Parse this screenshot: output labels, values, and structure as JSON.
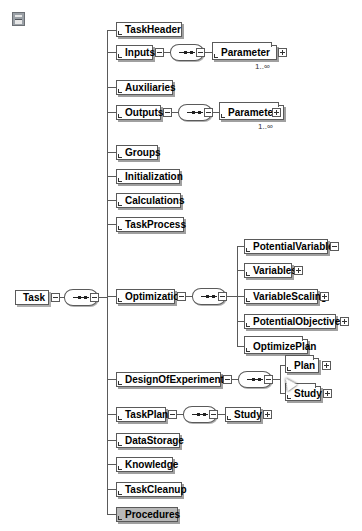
{
  "toolbar": {
    "icon": "schema-toggle-icon"
  },
  "root": {
    "label": "Task"
  },
  "children": [
    {
      "label": "TaskHeader"
    },
    {
      "label": "Inputs",
      "child": "Parameter",
      "occurrence": "1..∞"
    },
    {
      "label": "Auxiliaries"
    },
    {
      "label": "Outputs",
      "child": "Parameter",
      "occurrence": "1..∞"
    },
    {
      "label": "Groups"
    },
    {
      "label": "Initialization"
    },
    {
      "label": "Calculations"
    },
    {
      "label": "TaskProcess"
    },
    {
      "label": "Optimization",
      "children": [
        "PotentialVariables",
        "Variables",
        "VariableScaling",
        "PotentialObjectives",
        "OptimizePlan"
      ]
    },
    {
      "label": "DesignOfExperiments",
      "children": [
        "Plan",
        "Study"
      ]
    },
    {
      "label": "TaskPlan",
      "child": "Study"
    },
    {
      "label": "DataStorage"
    },
    {
      "label": "Knowledge"
    },
    {
      "label": "TaskCleanup"
    },
    {
      "label": "Procedures"
    }
  ]
}
